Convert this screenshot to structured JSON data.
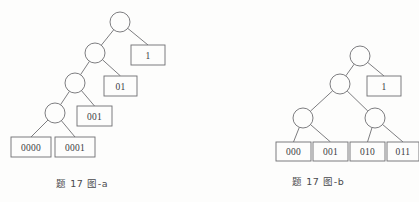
{
  "figure": {
    "background_color": "#fdfdfc",
    "stroke_color": "#6e6e72",
    "text_color": "#3b3b3f"
  },
  "panels": [
    {
      "id": "panel-a",
      "caption": "题 17 图-a",
      "tree_type": "skewed-binary-huffman-tree",
      "internal_nodes": [
        {
          "id": "a-n0",
          "cx": 120,
          "cy": 22,
          "r": 10
        },
        {
          "id": "a-n1",
          "cx": 95,
          "cy": 53,
          "r": 10
        },
        {
          "id": "a-n2",
          "cx": 75,
          "cy": 83,
          "r": 10
        },
        {
          "id": "a-n3",
          "cx": 55,
          "cy": 113,
          "r": 10
        }
      ],
      "leaves": [
        {
          "id": "a-l1",
          "label": "1",
          "x": 131,
          "y": 45,
          "w": 34,
          "h": 20
        },
        {
          "id": "a-l2",
          "label": "01",
          "x": 104,
          "y": 76,
          "w": 33,
          "h": 20
        },
        {
          "id": "a-l3",
          "label": "001",
          "x": 77,
          "y": 106,
          "w": 35,
          "h": 20
        },
        {
          "id": "a-l4",
          "label": "0000",
          "x": 11,
          "y": 137,
          "w": 40,
          "h": 20
        },
        {
          "id": "a-l5",
          "label": "0001",
          "x": 55,
          "y": 137,
          "w": 40,
          "h": 20
        }
      ],
      "edges": [
        {
          "from": "a-n0",
          "to": "a-n1"
        },
        {
          "from": "a-n0",
          "to": "a-l1"
        },
        {
          "from": "a-n1",
          "to": "a-n2"
        },
        {
          "from": "a-n1",
          "to": "a-l2"
        },
        {
          "from": "a-n2",
          "to": "a-n3"
        },
        {
          "from": "a-n2",
          "to": "a-l3"
        },
        {
          "from": "a-n3",
          "to": "a-l4"
        },
        {
          "from": "a-n3",
          "to": "a-l5"
        }
      ]
    },
    {
      "id": "panel-b",
      "caption": "题 17 图-b",
      "tree_type": "balanced-binary-huffman-tree",
      "internal_nodes": [
        {
          "id": "b-n0",
          "cx": 360,
          "cy": 56,
          "r": 10
        },
        {
          "id": "b-n1",
          "cx": 340,
          "cy": 84,
          "r": 10
        },
        {
          "id": "b-n2",
          "cx": 303,
          "cy": 118,
          "r": 10
        },
        {
          "id": "b-n3",
          "cx": 375,
          "cy": 118,
          "r": 10
        }
      ],
      "leaves": [
        {
          "id": "b-l1",
          "label": "1",
          "x": 367,
          "y": 76,
          "w": 34,
          "h": 20
        },
        {
          "id": "b-l2",
          "label": "000",
          "x": 276,
          "y": 142,
          "w": 35,
          "h": 19
        },
        {
          "id": "b-l3",
          "label": "001",
          "x": 313,
          "y": 142,
          "w": 35,
          "h": 19
        },
        {
          "id": "b-l4",
          "label": "010",
          "x": 350,
          "y": 142,
          "w": 35,
          "h": 19
        },
        {
          "id": "b-l5",
          "label": "011",
          "x": 387,
          "y": 142,
          "w": 32,
          "h": 19
        }
      ],
      "edges": [
        {
          "from": "b-n0",
          "to": "b-n1"
        },
        {
          "from": "b-n0",
          "to": "b-l1"
        },
        {
          "from": "b-n1",
          "to": "b-n2"
        },
        {
          "from": "b-n1",
          "to": "b-n3"
        },
        {
          "from": "b-n2",
          "to": "b-l2"
        },
        {
          "from": "b-n2",
          "to": "b-l3"
        },
        {
          "from": "b-n3",
          "to": "b-l4"
        },
        {
          "from": "b-n3",
          "to": "b-l5"
        }
      ]
    }
  ]
}
